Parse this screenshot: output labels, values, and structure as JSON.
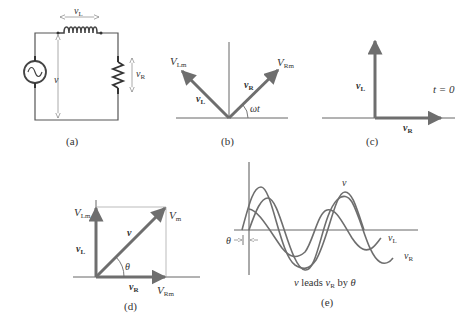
{
  "figure": {
    "panels": [
      {
        "id": "a",
        "caption": "(a)",
        "description": "Series RL circuit with AC source",
        "labels": {
          "vL": "v",
          "vL_sub": "L",
          "v": "v",
          "vR": "v",
          "vR_sub": "R"
        }
      },
      {
        "id": "b",
        "caption": "(b)",
        "description": "Phasors at angle ωt",
        "labels": {
          "VLm": "V",
          "VLm_sub": "Lm",
          "VRm": "V",
          "VRm_sub": "Rm",
          "vL": "v",
          "vL_sub": "L",
          "vR": "v",
          "vR_sub": "R",
          "angle": "ωt"
        }
      },
      {
        "id": "c",
        "caption": "(c)",
        "description": "Phasors at t = 0",
        "labels": {
          "vL": "v",
          "vL_sub": "L",
          "vR": "v",
          "vR_sub": "R",
          "time": "t = 0"
        }
      },
      {
        "id": "d",
        "caption": "(d)",
        "description": "Phasor sum v = vR + vL",
        "labels": {
          "VLm": "V",
          "VLm_sub": "Lm",
          "Vm": "V",
          "Vm_sub": "m",
          "v": "v",
          "vL": "v",
          "vL_sub": "L",
          "vR": "v",
          "vR_sub": "R",
          "VRm": "V",
          "VRm_sub": "Rm",
          "angle": "θ"
        }
      },
      {
        "id": "e",
        "caption": "(e)",
        "description": "Waveforms of v, vL, vR",
        "labels": {
          "v": "v",
          "vL": "v",
          "vL_sub": "L",
          "vR": "v",
          "vR_sub": "R",
          "theta": "θ",
          "note_pre": "v",
          "note_mid": " leads ",
          "note_v": "v",
          "note_sub": "R",
          "note_by": " by ",
          "note_theta": "θ"
        }
      }
    ],
    "colors": {
      "line": "#5a5a5a",
      "phasor": "#6e6e6e",
      "text": "#333333",
      "background": "#ffffff"
    }
  }
}
